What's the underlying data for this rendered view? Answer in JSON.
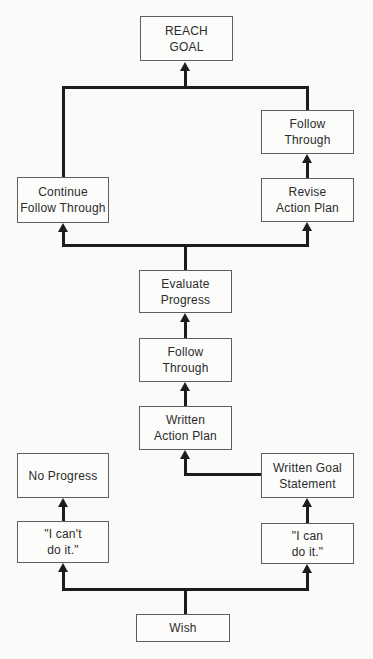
{
  "diagram": {
    "nodes": {
      "reach_goal": {
        "label": "REACH\nGOAL"
      },
      "follow_through_top": {
        "label": "Follow\nThrough"
      },
      "continue_follow_through": {
        "label": "Continue\nFollow Through"
      },
      "revise_action_plan": {
        "label": "Revise\nAction Plan"
      },
      "evaluate_progress": {
        "label": "Evaluate\nProgress"
      },
      "follow_through_mid": {
        "label": "Follow\nThrough"
      },
      "written_action_plan": {
        "label": "Written\nAction Plan"
      },
      "no_progress": {
        "label": "No Progress"
      },
      "written_goal_statement": {
        "label": "Written Goal\nStatement"
      },
      "i_cant_do_it": {
        "label": "\"I can't\ndo it.\""
      },
      "i_can_do_it": {
        "label": "\"I can\ndo it.\""
      },
      "wish": {
        "label": "Wish"
      }
    },
    "colors": {
      "background": "#fafaf8",
      "box_border": "#5f5f5f",
      "box_fill": "#fcfcfb",
      "connector_line": "#1c1c1c",
      "text": "#2b2b2b"
    }
  }
}
